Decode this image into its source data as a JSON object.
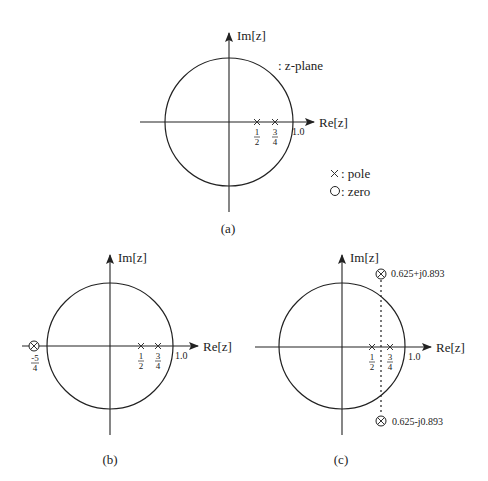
{
  "figure": {
    "panels": [
      {
        "id": "a",
        "caption": "(a)",
        "im_label": "Im[z]",
        "re_label": "Re[z]",
        "unit_label": "1.0",
        "plane_label": ": z-plane",
        "poles": [
          {
            "re": 0.5,
            "im": 0,
            "label_num": "1",
            "label_den": "2"
          },
          {
            "re": 0.75,
            "im": 0,
            "label_num": "3",
            "label_den": "4"
          }
        ],
        "zeros": []
      },
      {
        "id": "b",
        "caption": "(b)",
        "im_label": "Im[z]",
        "re_label": "Re[z]",
        "unit_label": "1.0",
        "poles": [
          {
            "re": 0.5,
            "im": 0,
            "label_num": "1",
            "label_den": "2"
          },
          {
            "re": 0.75,
            "im": 0,
            "label_num": "3",
            "label_den": "4"
          }
        ],
        "zeros": [
          {
            "re": -1.25,
            "im": 0,
            "label_num": "-5",
            "label_den": "4"
          }
        ]
      },
      {
        "id": "c",
        "caption": "(c)",
        "im_label": "Im[z]",
        "re_label": "Re[z]",
        "unit_label": "1.0",
        "poles": [
          {
            "re": 0.5,
            "im": 0,
            "label_num": "1",
            "label_den": "2"
          },
          {
            "re": 0.75,
            "im": 0,
            "label_num": "3",
            "label_den": "4"
          }
        ],
        "zeros": [
          {
            "re": 0.625,
            "im": 0.893,
            "label": "0.625+j0.893"
          },
          {
            "re": 0.625,
            "im": -0.893,
            "label": "0.625-j0.893"
          }
        ]
      }
    ],
    "legend": {
      "pole_symbol": "×",
      "pole_label": ": pole",
      "zero_symbol": "○",
      "zero_label": ": zero"
    }
  }
}
